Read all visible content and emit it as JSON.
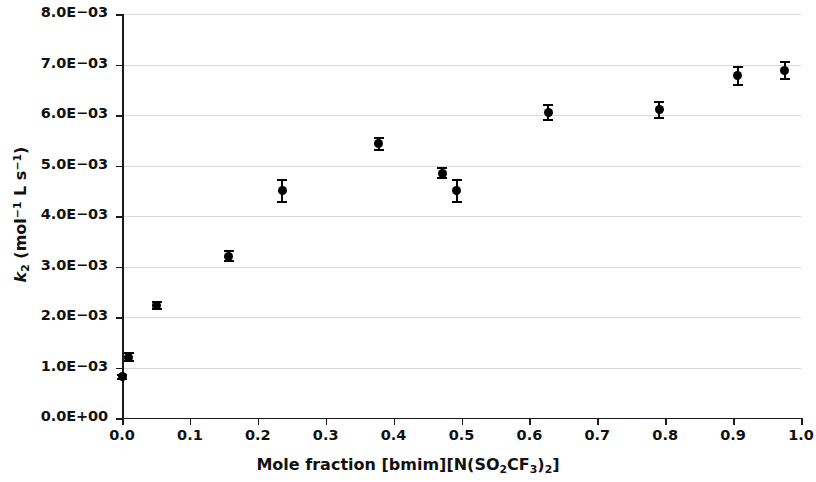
{
  "chart_data": {
    "type": "scatter",
    "title": "",
    "xlabel": "Mole fraction [bmim][N(SO2CF3)2]",
    "ylabel": "k2 (mol^-1 L s^-1)",
    "xlim": [
      0.0,
      1.0
    ],
    "ylim": [
      0.0,
      0.008
    ],
    "grid": true,
    "legend": "none",
    "xticks": [
      "0.0",
      "0.1",
      "0.2",
      "0.3",
      "0.4",
      "0.5",
      "0.6",
      "0.7",
      "0.8",
      "0.9",
      "1.0"
    ],
    "xtick_values": [
      0.0,
      0.1,
      0.2,
      0.3,
      0.4,
      0.5,
      0.6,
      0.7,
      0.8,
      0.9,
      1.0
    ],
    "yticks": [
      "0.0E+00",
      "1.0E−03",
      "2.0E−03",
      "3.0E−03",
      "4.0E−03",
      "5.0E−03",
      "6.0E−03",
      "7.0E−03",
      "8.0E−03"
    ],
    "ytick_values": [
      0.0,
      0.001,
      0.002,
      0.003,
      0.004,
      0.005,
      0.006,
      0.007,
      0.008
    ],
    "marker": "filled-circle",
    "marker_color": "#000000",
    "points": [
      {
        "x": 0.0,
        "y": 0.00082,
        "yerr": 4e-05
      },
      {
        "x": 0.01,
        "y": 0.0012,
        "yerr": 8e-05
      },
      {
        "x": 0.051,
        "y": 0.00223,
        "yerr": 7e-05
      },
      {
        "x": 0.157,
        "y": 0.0032,
        "yerr": 0.0001
      },
      {
        "x": 0.236,
        "y": 0.0045,
        "yerr": 0.00022
      },
      {
        "x": 0.378,
        "y": 0.00543,
        "yerr": 0.00012
      },
      {
        "x": 0.472,
        "y": 0.00485,
        "yerr": 0.0001
      },
      {
        "x": 0.493,
        "y": 0.0045,
        "yerr": 0.00022
      },
      {
        "x": 0.628,
        "y": 0.00605,
        "yerr": 0.00014
      },
      {
        "x": 0.791,
        "y": 0.0061,
        "yerr": 0.00016
      },
      {
        "x": 0.907,
        "y": 0.00678,
        "yerr": 0.00018
      },
      {
        "x": 0.976,
        "y": 0.00688,
        "yerr": 0.00016
      }
    ]
  },
  "labels": {
    "xlabel_parts": {
      "lead": "Mole fraction [bmim][N(SO",
      "sub1": "2",
      "mid": "CF",
      "sub2": "3",
      "close1": ")",
      "sub3": "2",
      "close2": "]"
    },
    "ylabel_parts": {
      "k": "k",
      "ksub": "2",
      "open": " (mol",
      "sup1": "−1",
      "mid": " L s",
      "sup2": "−1",
      "close": ")"
    }
  }
}
